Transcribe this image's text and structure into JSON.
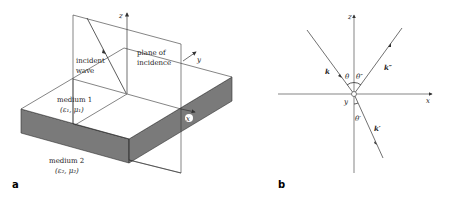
{
  "panel_a": {
    "label": "a",
    "axis_z": "z",
    "axis_y": "y",
    "axis_x": "x",
    "incident_wave": [
      "incident",
      "wave"
    ],
    "plane_of_incidence": [
      "plane of",
      "incidence"
    ],
    "medium1": {
      "name": "medium 1",
      "params": "(ε₁, μ₁)"
    },
    "medium2": {
      "name": "medium 2",
      "params": "(ε₂, μ₂)"
    }
  },
  "panel_b": {
    "label": "b",
    "axis_z": "z",
    "axis_x": "x",
    "axis_y": "y",
    "k": "k",
    "k_reflected": "k″",
    "k_transmitted": "k′",
    "theta": "θ",
    "theta_reflected": "θ″",
    "theta_transmitted": "θ′"
  },
  "colors": {
    "slab_side": "#7a7a7a",
    "line": "#333333"
  }
}
